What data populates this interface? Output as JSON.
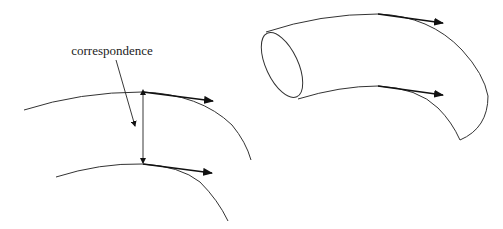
{
  "diagram": {
    "left_panel": {
      "label": "correspondence",
      "elements": [
        "outer-curve",
        "inner-curve",
        "outer-tangent-arrow",
        "inner-tangent-arrow",
        "correspondence-double-arrow",
        "label-pointer-arrow"
      ]
    },
    "right_panel": {
      "elements": [
        "curved-tube-surface",
        "tube-opening-ellipse",
        "top-tangent-arrow",
        "bottom-tangent-arrow"
      ]
    },
    "colors": {
      "stroke": "#333333",
      "arrow": "#111111",
      "background": "#ffffff"
    }
  }
}
